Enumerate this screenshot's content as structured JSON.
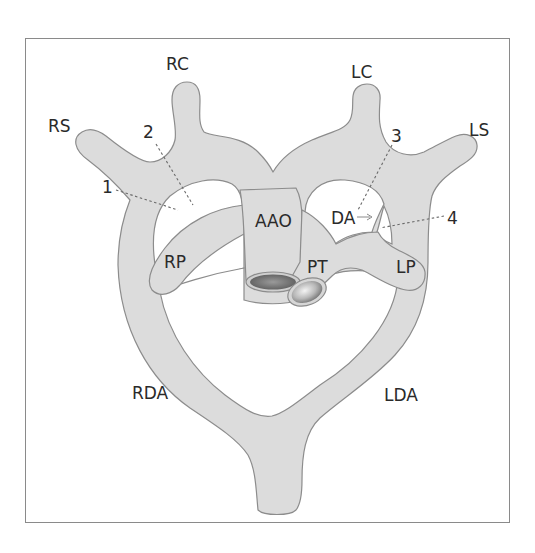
{
  "diagram": {
    "title": "",
    "colors": {
      "vessel_fill": "#dcdcdc",
      "vessel_stroke": "#8c8c8c",
      "frame": "#8a8a8a",
      "text": "#2a2a2a"
    },
    "labels": {
      "rc": "RC",
      "lc": "LC",
      "rs": "RS",
      "ls": "LS",
      "aao": "AAO",
      "da": "DA",
      "rp": "RP",
      "pt": "PT",
      "lp": "LP",
      "rda": "RDA",
      "lda": "LDA"
    },
    "markers": {
      "m1": "1",
      "m2": "2",
      "m3": "3",
      "m4": "4"
    }
  }
}
